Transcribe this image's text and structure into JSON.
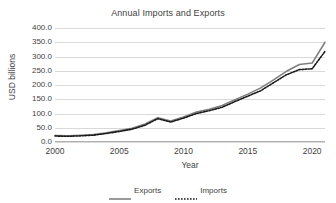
{
  "chart_data": {
    "type": "line",
    "title": "Annual Imports and Exports",
    "xlabel": "Year",
    "ylabel": "USD billions",
    "xlim": [
      2000,
      2021
    ],
    "ylim": [
      0,
      400
    ],
    "grid": "horizontal",
    "legend_position": "bottom",
    "y_ticks": [
      "400.0",
      "350.0",
      "300.0",
      "250.0",
      "200.0",
      "150.0",
      "100.0",
      "50.0",
      "0.0"
    ],
    "y_tick_values": [
      400,
      350,
      300,
      250,
      200,
      150,
      100,
      50,
      0
    ],
    "x_ticks": [
      "2000",
      "2005",
      "2010",
      "2015",
      "2020"
    ],
    "x_tick_values": [
      2000,
      2005,
      2010,
      2015,
      2020
    ],
    "x": [
      2000,
      2001,
      2002,
      2003,
      2004,
      2005,
      2006,
      2007,
      2008,
      2009,
      2010,
      2011,
      2012,
      2013,
      2014,
      2015,
      2016,
      2017,
      2018,
      2019,
      2020,
      2021
    ],
    "series": [
      {
        "name": "Exports",
        "style": "solid",
        "color": "#808080",
        "values": [
          23.0,
          22.0,
          23.5,
          26.0,
          32.0,
          40.0,
          48.0,
          63.0,
          85.0,
          74.0,
          88.0,
          105.0,
          115.0,
          128.0,
          148.0,
          168.0,
          190.0,
          218.0,
          248.0,
          272.0,
          277.0,
          350.0
        ]
      },
      {
        "name": "Imports",
        "style": "dotted",
        "color": "#1a1a1a",
        "values": [
          21.0,
          20.0,
          21.5,
          24.0,
          30.0,
          37.0,
          45.0,
          59.0,
          82.0,
          70.0,
          84.0,
          100.0,
          110.0,
          122.0,
          142.0,
          161.0,
          180.0,
          208.0,
          236.0,
          254.0,
          257.0,
          318.0
        ]
      }
    ]
  },
  "legend": {
    "entries": [
      {
        "label": "Exports"
      },
      {
        "label": "Imports"
      }
    ]
  }
}
